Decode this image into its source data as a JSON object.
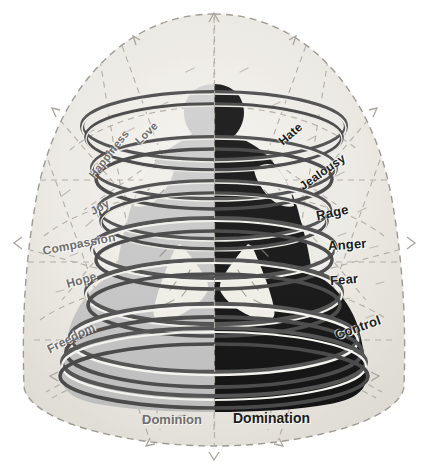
{
  "figure": {
    "axis_label": "vertical-center-divider"
  },
  "colors": {
    "dome_fill": "#e8e6e0",
    "dome_fill_outer": "#f3f2ee",
    "dome_dash": "#a8a49c",
    "body_light": "#c9c9c9",
    "body_dark": "#1e1e1e",
    "ring_dark": "#4a4a4a",
    "ring_light": "#f2f2f0",
    "label_left": "#6d6d6d",
    "label_right": "#1c1c1c",
    "background": "#ffffff"
  },
  "left_side": {
    "name": "Dominion",
    "tone": "light",
    "labels": [
      {
        "text": "Love",
        "x": 133,
        "y": 127,
        "rotate": -44,
        "size": 11
      },
      {
        "text": "Happiness",
        "x": 80,
        "y": 148,
        "rotate": -52,
        "size": 11
      },
      {
        "text": "Joy",
        "x": 90,
        "y": 201,
        "rotate": -30,
        "size": 11
      },
      {
        "text": "Compassion",
        "x": 42,
        "y": 237,
        "rotate": -11,
        "size": 12
      },
      {
        "text": "Hope",
        "x": 66,
        "y": 273,
        "rotate": -16,
        "size": 12
      },
      {
        "text": "Freedom",
        "x": 45,
        "y": 331,
        "rotate": -27,
        "size": 12
      }
    ]
  },
  "right_side": {
    "name": "Domination",
    "tone": "dark",
    "labels": [
      {
        "text": "Hate",
        "x": 277,
        "y": 127,
        "rotate": -41,
        "size": 12
      },
      {
        "text": "Jealousy",
        "x": 296,
        "y": 165,
        "rotate": -35,
        "size": 12
      },
      {
        "text": "Rage",
        "x": 316,
        "y": 205,
        "rotate": -12,
        "size": 13
      },
      {
        "text": "Anger",
        "x": 328,
        "y": 237,
        "rotate": -4,
        "size": 13
      },
      {
        "text": "Fear",
        "x": 330,
        "y": 272,
        "rotate": -5,
        "size": 13
      },
      {
        "text": "Control",
        "x": 334,
        "y": 320,
        "rotate": -20,
        "size": 13
      }
    ]
  },
  "base_labels": [
    {
      "text": "Dominion",
      "x": 142,
      "y": 412,
      "side": "left",
      "size": 13
    },
    {
      "text": "Domination",
      "x": 233,
      "y": 410,
      "side": "right",
      "size": 14
    }
  ],
  "rings": {
    "count": 6,
    "description": "spiral-coil-wrapping-figure"
  },
  "chart_data": {
    "type": "diagram",
    "axis": "vertical bisecting line",
    "series": [
      {
        "name": "Dominion",
        "values": [
          "Love",
          "Happiness",
          "Joy",
          "Compassion",
          "Hope",
          "Freedom"
        ]
      },
      {
        "name": "Domination",
        "values": [
          "Hate",
          "Jealousy",
          "Rage",
          "Anger",
          "Fear",
          "Control"
        ]
      }
    ]
  }
}
